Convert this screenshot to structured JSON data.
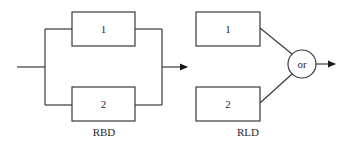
{
  "diagram": {
    "rbd": {
      "label": "RBD",
      "blocks": [
        {
          "id": "1",
          "label": "1"
        },
        {
          "id": "2",
          "label": "2"
        }
      ],
      "structure": "parallel"
    },
    "rld": {
      "label": "RLD",
      "blocks": [
        {
          "id": "1",
          "label": "1"
        },
        {
          "id": "2",
          "label": "2"
        }
      ],
      "gate": {
        "label": "or"
      }
    }
  }
}
